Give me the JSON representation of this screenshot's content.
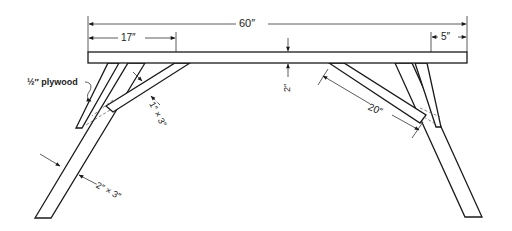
{
  "diagram": {
    "dimensions": {
      "overall_length": "60″",
      "leg_offset_left": "17″",
      "top_overhang_right": "5″",
      "top_thickness": "2″",
      "brace_length": "20″",
      "brace_stock": "1″ × 3″",
      "leg_stock": "2″ × 3″"
    },
    "callouts": {
      "plywood": "½″ plywood"
    },
    "colors": {
      "line": "#1a1a1a",
      "dim_line": "#333333",
      "background": "#ffffff"
    }
  }
}
